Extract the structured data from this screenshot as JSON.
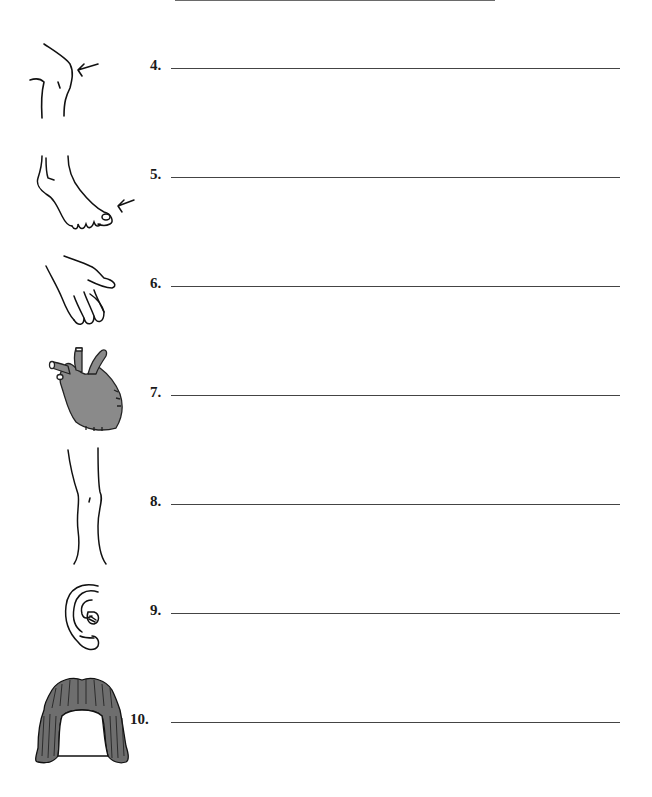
{
  "worksheet": {
    "items": [
      {
        "number": "4.",
        "image": "knee-icon",
        "answer": ""
      },
      {
        "number": "5.",
        "image": "toe-icon",
        "answer": ""
      },
      {
        "number": "6.",
        "image": "hand-icon",
        "answer": ""
      },
      {
        "number": "7.",
        "image": "heart-icon",
        "answer": ""
      },
      {
        "number": "8.",
        "image": "leg-icon",
        "answer": ""
      },
      {
        "number": "9.",
        "image": "ear-icon",
        "answer": ""
      },
      {
        "number": "10.",
        "image": "hair-icon",
        "answer": ""
      }
    ],
    "colors": {
      "ink": "#1a1a1a",
      "heart_fill": "#8a8a8a",
      "hair_fill": "#6e6e6e"
    }
  }
}
